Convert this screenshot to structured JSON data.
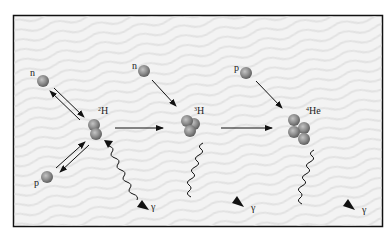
{
  "diagram": {
    "type": "nuclear-fusion-chain",
    "frame": {
      "x": 13,
      "y": 15,
      "width": 370,
      "height": 212,
      "background": "#f2f2f2",
      "border": "#111111"
    },
    "particle_color": "#8a8a8a",
    "stages": [
      {
        "id": "deuterium",
        "reactants": [
          {
            "symbol": "n",
            "label": "n",
            "x": 43,
            "y": 81
          },
          {
            "symbol": "p",
            "label": "p",
            "x": 47,
            "y": 177
          }
        ],
        "product": {
          "label": "²H",
          "sup": "2",
          "base": "H",
          "x": 94,
          "y": 130
        },
        "gamma": {
          "label": "γ"
        }
      },
      {
        "id": "tritium",
        "reactants": [
          {
            "symbol": "n",
            "label": "n",
            "x": 144,
            "y": 71
          }
        ],
        "product": {
          "label": "³H",
          "sup": "3",
          "base": "H",
          "x": 190,
          "y": 125
        },
        "gamma": {
          "label": "γ"
        }
      },
      {
        "id": "helium",
        "reactants": [
          {
            "symbol": "p",
            "label": "p",
            "x": 246,
            "y": 73
          }
        ],
        "product": {
          "label": "⁴He",
          "sup": "4",
          "base": "He",
          "x": 300,
          "y": 127
        },
        "gamma": {
          "label": "γ"
        }
      }
    ]
  }
}
